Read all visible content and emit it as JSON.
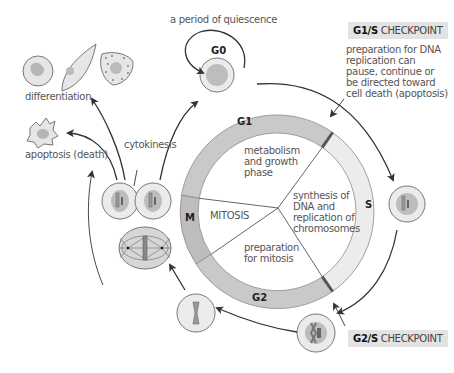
{
  "diagram": {
    "phases": {
      "G0": "G0",
      "G1": "G1",
      "S": "S",
      "G2": "G2",
      "M": "M"
    },
    "segments": {
      "g1_desc": [
        "metabolism",
        "and growth",
        "phase"
      ],
      "s_desc": [
        "synthesis of",
        "DNA and",
        "replication of",
        "chromosomes"
      ],
      "g2_desc": [
        "preparation",
        "for mitosis"
      ],
      "m_desc": "MITOSIS"
    },
    "labels": {
      "quiescence": "a period of quiescence",
      "differentiation": "differentiation",
      "apoptosis": "apoptosis (death)",
      "cytokinesis": "cytokinesis"
    },
    "checkpoints": {
      "g1s": {
        "code": "G1/S",
        "word": "CHECKPOINT",
        "desc": [
          "preparation for DNA",
          "replication can",
          "pause, continue or",
          "be directed toward",
          "cell death (apoptosis)"
        ]
      },
      "g2s": {
        "code": "G2/S",
        "word": "CHECKPOINT"
      }
    },
    "colors": {
      "ring_dark": "#c9c9c9",
      "ring_light": "#ececec",
      "cell_fill": "#ebebeb",
      "nucleus": "#bdbdbd",
      "stroke": "#777777",
      "arrow": "#333333",
      "checkpoint_box": "#e3e3e3"
    }
  }
}
